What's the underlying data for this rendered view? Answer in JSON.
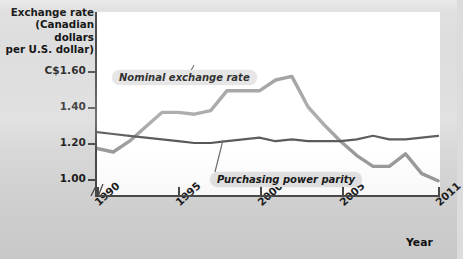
{
  "chart_data": {
    "type": "line",
    "title": "",
    "ylabel": "Exchange rate (Canadian dollars per U.S. dollar)",
    "xlabel": "Year",
    "ylim": [
      0.95,
      1.7
    ],
    "y_ticks": [
      1.0,
      1.2,
      1.4,
      1.6
    ],
    "y_tick_labels": [
      "1.00",
      "1.20",
      "1.40",
      "C$1.60"
    ],
    "xlim": [
      1990,
      2011
    ],
    "x_ticks": [
      1990,
      1995,
      2000,
      2005,
      2011
    ],
    "x_tick_labels": [
      "1990",
      "1995",
      "2000",
      "2005",
      "2011"
    ],
    "grid": false,
    "axis_break": true,
    "legend_position": "inline-annotations",
    "x": [
      1990,
      1991,
      1992,
      1993,
      1994,
      1995,
      1996,
      1997,
      1998,
      1999,
      2000,
      2001,
      2002,
      2003,
      2004,
      2005,
      2006,
      2007,
      2008,
      2009,
      2010,
      2011
    ],
    "series": [
      {
        "name": "Nominal exchange rate",
        "color": "#9a9a9a",
        "width": 3.4,
        "values": [
          1.17,
          1.15,
          1.21,
          1.29,
          1.37,
          1.37,
          1.36,
          1.38,
          1.49,
          1.49,
          1.49,
          1.55,
          1.57,
          1.4,
          1.3,
          1.21,
          1.13,
          1.07,
          1.07,
          1.14,
          1.03,
          0.99
        ]
      },
      {
        "name": "Purchasing power parity",
        "color": "#4f4f4f",
        "width": 2.2,
        "values": [
          1.26,
          1.25,
          1.24,
          1.23,
          1.22,
          1.21,
          1.2,
          1.2,
          1.21,
          1.22,
          1.23,
          1.21,
          1.22,
          1.21,
          1.21,
          1.21,
          1.22,
          1.24,
          1.22,
          1.22,
          1.23,
          1.24
        ]
      }
    ],
    "annotations": [
      {
        "text": "Nominal exchange rate",
        "name": "annotation-nominal"
      },
      {
        "text": "Purchasing power parity",
        "name": "annotation-ppp"
      }
    ]
  },
  "axis_titles": {
    "y_line1": "Exchange rate",
    "y_line2": "(Canadian dollars",
    "y_line3": "per U.S. dollar)",
    "x": "Year"
  }
}
